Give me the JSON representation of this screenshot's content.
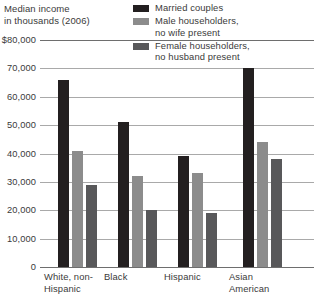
{
  "title": {
    "line1": "Median income",
    "line2": "in thousands (2006)"
  },
  "legend": {
    "position": "top-right",
    "items": [
      {
        "label": "Married couples",
        "color": "#231f20"
      },
      {
        "label": "Male householders,\nno wife present",
        "color": "#8c8c8c"
      },
      {
        "label": "Female householders,\nno husband present",
        "color": "#58585a"
      }
    ]
  },
  "axis": {
    "y_ticks": [
      "$80,000",
      "70,000",
      "60,000",
      "50,000",
      "40,000",
      "30,000",
      "20,000",
      "10,000",
      "0"
    ],
    "x_categories": [
      "White, non-\nHispanic",
      "Black",
      "Hispanic",
      "Asian\nAmerican"
    ]
  },
  "chart_data": {
    "type": "bar",
    "title": "Median income in thousands (2006)",
    "xlabel": "",
    "ylabel": "Median income in thousands (2006)",
    "ylim": [
      0,
      80000
    ],
    "ytick_values": [
      80000,
      70000,
      60000,
      50000,
      40000,
      30000,
      20000,
      10000,
      0
    ],
    "grid": true,
    "legend_position": "top-right",
    "categories": [
      "White, non-Hispanic",
      "Black",
      "Hispanic",
      "Asian American"
    ],
    "series": [
      {
        "name": "Married couples",
        "color": "#231f20",
        "values": [
          66000,
          51000,
          39000,
          70000
        ]
      },
      {
        "name": "Male householders, no wife present",
        "color": "#8c8c8c",
        "values": [
          41000,
          32000,
          33000,
          44000
        ]
      },
      {
        "name": "Female householders, no husband present",
        "color": "#58585a",
        "values": [
          29000,
          20000,
          19000,
          38000
        ]
      }
    ]
  },
  "layout": {
    "group_left_px": [
      18,
      78,
      138,
      203
    ],
    "plot_height_px": 227
  }
}
